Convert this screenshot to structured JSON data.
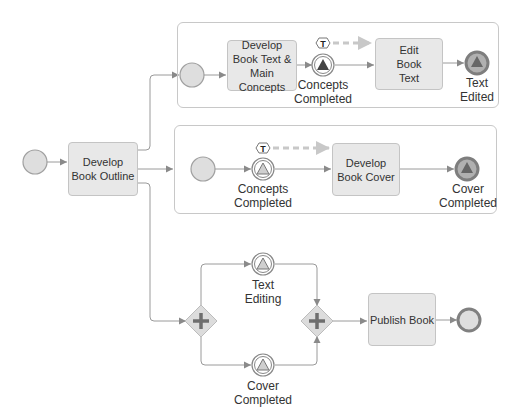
{
  "diagram": {
    "type": "BPMN process",
    "start_event": {
      "label": ""
    },
    "tasks": {
      "develop_outline": "Develop Book Outline",
      "develop_text": "Develop Book Text & Main Concepts",
      "edit_text": "Edit Book Text",
      "develop_cover": "Develop Book Cover",
      "publish_book": "Publish Book"
    },
    "events": {
      "concepts_completed_top": "Concepts Completed",
      "text_edited": "Text Edited",
      "concepts_completed_mid": "Concepts Completed",
      "cover_completed_mid": "Cover Completed",
      "text_editing": "Text Editing",
      "cover_completed_bottom": "Cover Completed"
    },
    "markers": {
      "timer_top": "T",
      "timer_mid": "T"
    },
    "gateways": [
      "parallel-split",
      "parallel-join"
    ],
    "colors": {
      "task_fill": "#e8e8e8",
      "event_fill": "#dcdcdc",
      "stroke": "#9a9a9a",
      "dashed_flow": "#c8c8c8",
      "end_event": "#8c8c8c"
    }
  }
}
